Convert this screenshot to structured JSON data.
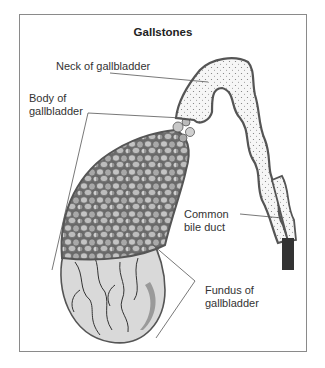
{
  "diagram": {
    "title": "Gallstones",
    "labels": {
      "neck": "Neck of gallbladder",
      "body_line1": "Body of",
      "body_line2": "gallbladder",
      "duct_line1": "Common",
      "duct_line2": "bile duct",
      "fundus_line1": "Fundus of",
      "fundus_line2": "gallbladder"
    },
    "colors": {
      "outline": "#555555",
      "stones_fill": "#b8b8b8",
      "stones_dark": "#8c8c8c",
      "fundus_fill": "#dcdcdc",
      "duct_fill": "#f4f4f4",
      "duct_end": "#333333",
      "frame": "#8a8a8a"
    }
  }
}
